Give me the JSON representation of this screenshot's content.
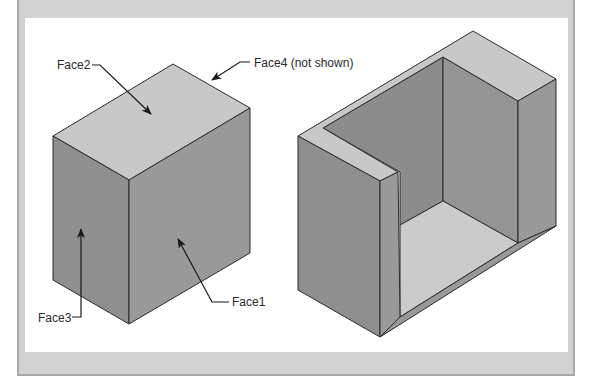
{
  "figure": {
    "labels": {
      "face1": "Face1",
      "face2": "Face2",
      "face3": "Face3",
      "face4": "Face4 (not shown)"
    },
    "colors": {
      "frame": "#d2d2d2",
      "panel": "#ffffff",
      "top_face": "#c8c8c8",
      "side_face_left": "#8f8f8f",
      "side_face_right": "#999999",
      "inner_wall": "#8c8c8c",
      "floor": "#cbcbcb",
      "edge": "#2b2b2b"
    }
  }
}
